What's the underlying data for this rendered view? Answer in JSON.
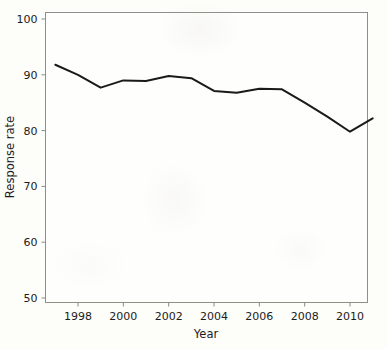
{
  "chart_data": {
    "type": "line",
    "title": "",
    "subtitle": "",
    "xlabel": "Year",
    "ylabel": "Response rate",
    "xlim": [
      1996.6,
      1996.6
    ],
    "ylim": [
      48.6,
      101.5
    ],
    "grid": false,
    "legend": null,
    "x": [
      1997,
      1998,
      1999,
      2000,
      2001,
      2002,
      2003,
      2004,
      2005,
      2006,
      2007,
      2008,
      2009,
      2010,
      2011
    ],
    "values": [
      91.8,
      90.0,
      87.7,
      89.0,
      88.9,
      89.8,
      89.4,
      87.1,
      86.8,
      87.5,
      87.4,
      85.0,
      82.5,
      79.8,
      82.2
    ],
    "series": [
      {
        "name": "Response rate",
        "color": "#1a1a1a",
        "values": [
          91.8,
          90.0,
          87.7,
          89.0,
          88.9,
          89.8,
          89.4,
          87.1,
          86.8,
          87.5,
          87.4,
          85.0,
          82.5,
          79.8,
          82.2
        ]
      }
    ],
    "x_tick_labels": [
      "1998",
      "2000",
      "2002",
      "2004",
      "2006",
      "2008",
      "2010"
    ],
    "x_tick_values": [
      1998,
      2000,
      2002,
      2004,
      2006,
      2008,
      2010
    ],
    "y_tick_labels": [
      "50",
      "60",
      "70",
      "80",
      "90",
      "100"
    ],
    "y_tick_values": [
      50,
      60,
      70,
      80,
      90,
      100
    ],
    "axis_color": "#8a8a85",
    "line_color": "#1a1a1a",
    "background_color": "#fdfdfa"
  },
  "axes": {
    "y_label": "Response rate",
    "x_label": "Year"
  },
  "y_ticks": [
    {
      "label": "100",
      "value": 100
    },
    {
      "label": "90",
      "value": 90
    },
    {
      "label": "80",
      "value": 80
    },
    {
      "label": "70",
      "value": 70
    },
    {
      "label": "60",
      "value": 60
    },
    {
      "label": "50",
      "value": 50
    }
  ],
  "x_ticks": [
    {
      "label": "1998",
      "value": 1998
    },
    {
      "label": "2000",
      "value": 2000
    },
    {
      "label": "2002",
      "value": 2002
    },
    {
      "label": "2004",
      "value": 2004
    },
    {
      "label": "2006",
      "value": 2006
    },
    {
      "label": "2008",
      "value": 2008
    },
    {
      "label": "2010",
      "value": 2010
    }
  ]
}
